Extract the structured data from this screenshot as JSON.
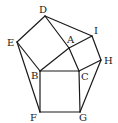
{
  "diagram": {
    "title": "",
    "points": {
      "A": {
        "label": "A",
        "x": 69,
        "y": 48,
        "lx": 67,
        "ly": 43
      },
      "B": {
        "label": "B",
        "x": 40,
        "y": 71,
        "lx": 31,
        "ly": 79
      },
      "C": {
        "label": "C",
        "x": 79,
        "y": 71,
        "lx": 81,
        "ly": 80
      },
      "D": {
        "label": "D",
        "x": 45,
        "y": 16,
        "lx": 39,
        "ly": 13
      },
      "E": {
        "label": "E",
        "x": 17,
        "y": 42,
        "lx": 7,
        "ly": 46
      },
      "F": {
        "label": "F",
        "x": 40,
        "y": 112,
        "lx": 30,
        "ly": 121
      },
      "G": {
        "label": "G",
        "x": 80,
        "y": 112,
        "lx": 79,
        "ly": 121
      },
      "H": {
        "label": "H",
        "x": 101,
        "y": 60,
        "lx": 104,
        "ly": 64
      },
      "I": {
        "label": "I",
        "x": 92,
        "y": 36,
        "lx": 94,
        "ly": 34
      }
    },
    "segments": [
      [
        "D",
        "A"
      ],
      [
        "A",
        "C"
      ],
      [
        "A",
        "B"
      ],
      [
        "B",
        "E"
      ],
      [
        "E",
        "D"
      ],
      [
        "A",
        "I"
      ],
      [
        "I",
        "H"
      ],
      [
        "H",
        "C"
      ],
      [
        "B",
        "C"
      ],
      [
        "C",
        "G"
      ],
      [
        "G",
        "F"
      ],
      [
        "F",
        "B"
      ],
      [
        "D",
        "I"
      ],
      [
        "E",
        "F"
      ],
      [
        "H",
        "G"
      ]
    ],
    "stroke_color": "#1a1a1a",
    "background": "#ffffff"
  }
}
